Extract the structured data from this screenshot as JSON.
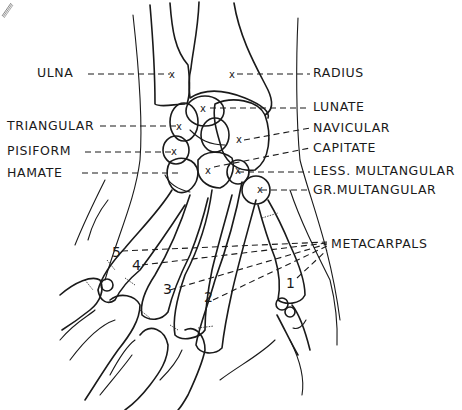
{
  "figure": {
    "labels_left": [
      {
        "id": "ulna",
        "text": "ULNA"
      },
      {
        "id": "triangular",
        "text": "TRIANGULAR"
      },
      {
        "id": "pisiform",
        "text": "PISIFORM"
      },
      {
        "id": "hamate",
        "text": "HAMATE"
      }
    ],
    "labels_right": [
      {
        "id": "radius",
        "text": "RADIUS"
      },
      {
        "id": "lunate",
        "text": "LUNATE"
      },
      {
        "id": "navicular",
        "text": "NAVICULAR"
      },
      {
        "id": "capitate",
        "text": "CAPITATE"
      },
      {
        "id": "less_multangular",
        "text": "LESS. MULTANGULAR"
      },
      {
        "id": "gr_multangular",
        "text": "GR.MULTANGULAR"
      },
      {
        "id": "metacarpals",
        "text": "METACARPALS"
      }
    ],
    "metacarpal_numbers": [
      "1",
      "2",
      "3",
      "4",
      "5"
    ],
    "marker_symbol": "x",
    "colors": {
      "ink": "#1a1a1a",
      "background": "#ffffff"
    }
  }
}
